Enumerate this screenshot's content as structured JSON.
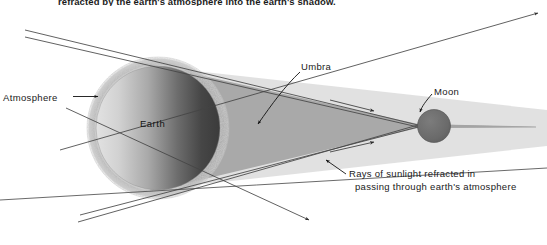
{
  "figure": {
    "caption_top": "refracted by the earth's atmosphere into the earth's shadow.",
    "labels": {
      "atmosphere": "Atmosphere",
      "earth": "Earth",
      "umbra": "Umbra",
      "moon": "Moon",
      "rays_line1": "Rays of sunlight refracted in",
      "rays_line2": "passing through earth's atmosphere"
    },
    "colors": {
      "background": "#ffffff",
      "umbra_fill": "#a9a9a9",
      "penumbra_fill": "#bdbdbd",
      "earth_light": "#d8d8d8",
      "earth_dark": "#3f3f3f",
      "atmosphere_ring": "#b9b9b9",
      "moon_fill": "#6b6b6b",
      "line": "#3a3a3a",
      "text": "#1a1a1a"
    },
    "geometry": {
      "earth_center_x": 158,
      "earth_center_y": 128,
      "earth_radius": 62,
      "atmosphere_radius": 72,
      "moon_center_x": 434,
      "moon_center_y": 126,
      "moon_radius": 16,
      "umbra_apex_x": 418,
      "umbra_apex_y": 126,
      "shadow_tip_x": 536,
      "shadow_tip_y": 127
    }
  }
}
